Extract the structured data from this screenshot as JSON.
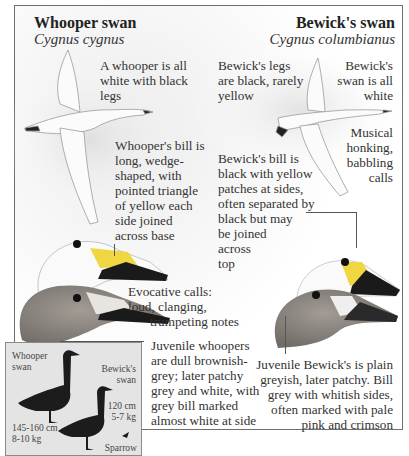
{
  "whooper": {
    "title": "Whooper swan",
    "latin": "Cygnus cygnus",
    "notes": {
      "plumage": [
        "A whooper is all",
        "white with black",
        "legs"
      ],
      "bill": [
        "Whooper's bill is",
        "long, wedge-",
        "shaped, with",
        "pointed triangle",
        "of yellow each",
        "side joined",
        "across base"
      ],
      "calls": [
        "Evocative calls:",
        "loud, clanging,",
        "trumpeting notes"
      ],
      "juvenile": [
        "Juvenile whoopers",
        "are dull brownish-",
        "grey; later patchy",
        "grey and white, with",
        "grey bill marked",
        "almost white at side"
      ]
    }
  },
  "bewicks": {
    "title": "Bewick's swan",
    "latin": "Cygnus columbianus",
    "notes": {
      "legs": [
        "Bewick's legs",
        "are black, rarely",
        "yellow"
      ],
      "plumage": [
        "Bewick's",
        "swan is all",
        "white"
      ],
      "calls": [
        "Musical",
        "honking,",
        "babbling",
        "calls"
      ],
      "bill": [
        "Bewick's bill is",
        "black with yellow",
        "patches at sides,",
        "often separated by",
        "black but may",
        "be joined",
        "across",
        "top"
      ],
      "juvenile": [
        "Juvenile Bewick's is plain",
        "greyish, later patchy. Bill",
        "grey with whitish sides,",
        "often marked with pale",
        "pink and crimson"
      ]
    }
  },
  "size_inset": {
    "whooper_label": [
      "Whooper",
      "swan"
    ],
    "bewicks_label": [
      "Bewick's",
      "swan"
    ],
    "whooper_size": [
      "145-160 cm",
      "8-10 kg"
    ],
    "bewicks_size": [
      "120 cm",
      "5-7 kg"
    ],
    "sparrow_label": "Sparrow"
  },
  "colors": {
    "bill_yellow": "#f0d640",
    "bill_black": "#1a1a1a",
    "juvenile_grey": "#8a8580",
    "silhouette": "#1c1c1c",
    "frame": "#6e6e6e"
  }
}
